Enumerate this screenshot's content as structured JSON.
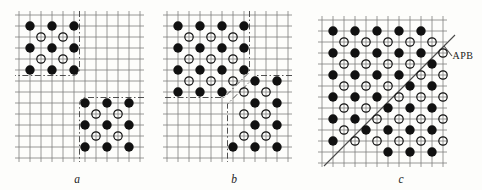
{
  "figure": {
    "apb_label": "APB"
  },
  "colors": {
    "background": "#fdfdfb",
    "grid": "#7d7d7d",
    "atom": "#111111",
    "boundary": "#3c3c3c",
    "apb_line": "#4a4a4a",
    "label": "#1c1c1c"
  },
  "lattice": {
    "cols": 12,
    "rows": 14,
    "spacing": 11,
    "overhang": 4,
    "filled_radius": 4.7,
    "open_radius": 4.2,
    "open_stroke": 1.2,
    "grid_stroke": 0.8
  },
  "panels": [
    {
      "id": "a",
      "label": "a",
      "origin": {
        "x": 19,
        "y": 15
      },
      "label_pos": {
        "x": 77,
        "y": 183
      },
      "atoms": {
        "filled": [
          [
            1,
            1
          ],
          [
            3,
            1
          ],
          [
            5,
            1
          ],
          [
            1,
            3
          ],
          [
            3,
            3
          ],
          [
            5,
            3
          ],
          [
            1,
            5
          ],
          [
            3,
            5
          ],
          [
            5,
            5
          ],
          [
            6,
            8
          ],
          [
            8,
            8
          ],
          [
            10,
            8
          ],
          [
            6,
            10
          ],
          [
            8,
            10
          ],
          [
            10,
            10
          ],
          [
            6,
            12
          ],
          [
            8,
            12
          ],
          [
            10,
            12
          ]
        ],
        "open": [
          [
            2,
            2
          ],
          [
            4,
            2
          ],
          [
            2,
            4
          ],
          [
            4,
            4
          ],
          [
            7,
            9
          ],
          [
            9,
            9
          ],
          [
            7,
            11
          ],
          [
            9,
            11
          ]
        ]
      },
      "boundaries": [
        {
          "name": "domain1-boundary",
          "d": "M60.5,-4 L60.5,53 Q60.5,60.5 53,60.5 L-4,60.5"
        },
        {
          "name": "domain2-boundary",
          "d": "M125,82.5 L68,82.5 Q60.5,82.5 60.5,90 L60.5,147"
        }
      ],
      "lines": []
    },
    {
      "id": "b",
      "label": "b",
      "origin": {
        "x": 167,
        "y": 15
      },
      "label_pos": {
        "x": 234,
        "y": 183
      },
      "atoms": {
        "filled": [
          [
            1,
            1
          ],
          [
            3,
            1
          ],
          [
            5,
            1
          ],
          [
            7,
            1
          ],
          [
            1,
            3
          ],
          [
            3,
            3
          ],
          [
            5,
            3
          ],
          [
            7,
            3
          ],
          [
            1,
            5
          ],
          [
            3,
            5
          ],
          [
            5,
            5
          ],
          [
            7,
            5
          ],
          [
            1,
            7
          ],
          [
            3,
            7
          ],
          [
            5,
            7
          ],
          [
            8,
            6
          ],
          [
            10,
            6
          ],
          [
            8,
            8
          ],
          [
            10,
            8
          ],
          [
            8,
            10
          ],
          [
            10,
            10
          ],
          [
            6,
            12
          ],
          [
            8,
            12
          ],
          [
            10,
            12
          ]
        ],
        "open": [
          [
            2,
            2
          ],
          [
            4,
            2
          ],
          [
            6,
            2
          ],
          [
            2,
            4
          ],
          [
            4,
            4
          ],
          [
            6,
            4
          ],
          [
            2,
            6
          ],
          [
            4,
            6
          ],
          [
            6,
            6
          ],
          [
            7,
            7
          ],
          [
            9,
            7
          ],
          [
            7,
            9
          ],
          [
            9,
            9
          ],
          [
            7,
            11
          ],
          [
            9,
            11
          ]
        ]
      },
      "boundaries": [
        {
          "name": "domain1-boundary",
          "d": "M82.5,-4 L82.5,57 L57,82.5 L-4,82.5"
        },
        {
          "name": "domain2-boundary",
          "d": "M125,60.5 L89,60.5 L60.5,89 L60.5,147"
        }
      ],
      "lines": []
    },
    {
      "id": "c",
      "label": "c",
      "origin": {
        "x": 322,
        "y": 20
      },
      "label_pos": {
        "x": 401,
        "y": 183
      },
      "atoms": {
        "filled": [
          [
            1,
            1
          ],
          [
            3,
            1
          ],
          [
            5,
            1
          ],
          [
            7,
            1
          ],
          [
            9,
            1
          ],
          [
            1,
            3
          ],
          [
            3,
            3
          ],
          [
            5,
            3
          ],
          [
            7,
            3
          ],
          [
            9,
            3
          ],
          [
            10,
            4
          ],
          [
            1,
            5
          ],
          [
            3,
            5
          ],
          [
            5,
            5
          ],
          [
            7,
            5
          ],
          [
            8,
            6
          ],
          [
            10,
            6
          ],
          [
            1,
            7
          ],
          [
            3,
            7
          ],
          [
            5,
            7
          ],
          [
            6,
            8
          ],
          [
            8,
            8
          ],
          [
            10,
            8
          ],
          [
            1,
            9
          ],
          [
            3,
            9
          ],
          [
            4,
            10
          ],
          [
            6,
            10
          ],
          [
            8,
            10
          ],
          [
            10,
            10
          ],
          [
            1,
            11
          ],
          [
            6,
            12
          ],
          [
            8,
            12
          ],
          [
            10,
            12
          ]
        ],
        "open": [
          [
            2,
            2
          ],
          [
            4,
            2
          ],
          [
            6,
            2
          ],
          [
            8,
            2
          ],
          [
            10,
            2
          ],
          [
            11,
            3
          ],
          [
            2,
            4
          ],
          [
            4,
            4
          ],
          [
            6,
            4
          ],
          [
            8,
            4
          ],
          [
            9,
            5
          ],
          [
            11,
            5
          ],
          [
            2,
            6
          ],
          [
            4,
            6
          ],
          [
            6,
            6
          ],
          [
            7,
            7
          ],
          [
            9,
            7
          ],
          [
            11,
            7
          ],
          [
            2,
            8
          ],
          [
            4,
            8
          ],
          [
            5,
            9
          ],
          [
            7,
            9
          ],
          [
            9,
            9
          ],
          [
            11,
            9
          ],
          [
            2,
            10
          ],
          [
            3,
            11
          ],
          [
            5,
            11
          ],
          [
            7,
            11
          ],
          [
            9,
            11
          ],
          [
            11,
            11
          ]
        ]
      },
      "boundaries": [],
      "lines": [
        {
          "name": "apb-line",
          "d": "M2,146 L133,15"
        },
        {
          "name": "apb-pointer",
          "d": "M122,26 L130,36"
        }
      ],
      "annotation": {
        "text": "APB",
        "x": 452.5,
        "y": 59
      }
    }
  ]
}
